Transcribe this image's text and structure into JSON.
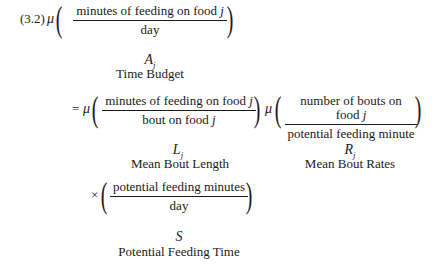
{
  "equation": {
    "number": "(3.2)",
    "mu": "μ",
    "equals": "=",
    "times": "×",
    "j": "j",
    "line1": {
      "numerator": "minutes of feeding on food ",
      "denominator": "day",
      "symbol": "A",
      "subscript": "j",
      "label": "Time Budget"
    },
    "line2": {
      "fraction1": {
        "numerator": "minutes of feeding on food ",
        "denominator": "bout on food ",
        "symbol": "L",
        "subscript": "j",
        "label": "Mean Bout Length"
      },
      "fraction2": {
        "numerator": "number of bouts on food ",
        "denominator": "potential feeding minute",
        "symbol": "R",
        "subscript": "j",
        "label": "Mean Bout Rates"
      }
    },
    "line3": {
      "numerator": "potential feeding minutes",
      "denominator": "day",
      "symbol": "S",
      "label": "Potential Feeding Time"
    }
  }
}
